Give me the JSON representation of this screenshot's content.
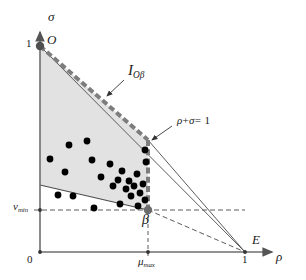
{
  "figure": {
    "colors": {
      "axis": "#6e6e6e",
      "shade_fill": "#e2e2e2",
      "shade_stroke": "#5a5a5a",
      "thick_dashed": "#7d7d7d",
      "thin_line": "#6b6b6b",
      "dashed_guide": "#4a4a4a",
      "dot": "#000000",
      "text": "#1a1a1a"
    },
    "axes": {
      "y_label": "σ",
      "x_label": "ρ",
      "origin_label": "0",
      "y_tick_label": "1",
      "x_tick_label": "1"
    },
    "labels": {
      "point_O": "O",
      "point_E": "E",
      "point_beta": "β",
      "interval_I": "I",
      "interval_I_sub": "Oβ",
      "constraint_line": "ρ + σ = 1",
      "constraint_rho": "ρ",
      "constraint_plus": "+",
      "constraint_sigma": "σ",
      "constraint_eq": "= 1",
      "nu_min": "ν",
      "nu_min_sub": "min",
      "mu_max": "μ",
      "mu_max_sub": "max"
    },
    "geometry": {
      "origin": [
        40,
        252
      ],
      "point_O": [
        40,
        46
      ],
      "point_E": [
        245,
        252
      ],
      "apex": [
        148,
        140
      ],
      "point_beta": [
        148,
        210
      ],
      "lower_left": [
        40,
        185
      ],
      "nu_min_y": 210,
      "mu_max_x": 148,
      "polygon": "40,46 148,140 148,210 40,185"
    },
    "chart_data": {
      "type": "scatter",
      "title": "",
      "xlabel": "ρ",
      "ylabel": "σ",
      "xlim": [
        0,
        1
      ],
      "ylim": [
        0,
        1
      ],
      "grid": false,
      "legend": null,
      "annotations": [
        {
          "text": "I_{Oβ}",
          "at": [
            128,
            72
          ]
        },
        {
          "text": "ρ + σ = 1",
          "at": [
            196,
            124
          ]
        },
        {
          "text": "O",
          "at": [
            48,
            42
          ]
        },
        {
          "text": "E",
          "at": [
            255,
            236
          ]
        },
        {
          "text": "β",
          "at": [
            147,
            221
          ]
        },
        {
          "text": "ν_min",
          "at": [
            18,
            208
          ]
        },
        {
          "text": "μ_max",
          "at": [
            146,
            263
          ]
        }
      ],
      "points_px": [
        [
          50,
          159
        ],
        [
          69,
          145
        ],
        [
          65,
          172
        ],
        [
          87,
          141
        ],
        [
          92,
          160
        ],
        [
          101,
          177
        ],
        [
          110,
          164
        ],
        [
          113,
          186
        ],
        [
          118,
          180
        ],
        [
          122,
          171
        ],
        [
          126,
          189
        ],
        [
          129,
          181
        ],
        [
          131,
          196
        ],
        [
          134,
          186
        ],
        [
          137,
          174
        ],
        [
          140,
          193
        ],
        [
          143,
          184
        ],
        [
          145,
          200
        ],
        [
          138,
          206
        ],
        [
          146,
          162
        ],
        [
          145,
          150
        ],
        [
          58,
          195
        ],
        [
          73,
          196
        ],
        [
          94,
          208
        ],
        [
          120,
          204
        ]
      ],
      "points_data": [
        [
          0.049,
          0.451
        ],
        [
          0.141,
          0.519
        ],
        [
          0.122,
          0.388
        ],
        [
          0.229,
          0.539
        ],
        [
          0.254,
          0.446
        ],
        [
          0.298,
          0.364
        ],
        [
          0.341,
          0.427
        ],
        [
          0.356,
          0.32
        ],
        [
          0.38,
          0.35
        ],
        [
          0.4,
          0.393
        ],
        [
          0.42,
          0.306
        ],
        [
          0.434,
          0.345
        ],
        [
          0.444,
          0.272
        ],
        [
          0.459,
          0.32
        ],
        [
          0.473,
          0.379
        ],
        [
          0.488,
          0.287
        ],
        [
          0.502,
          0.33
        ],
        [
          0.512,
          0.253
        ],
        [
          0.478,
          0.224
        ],
        [
          0.517,
          0.437
        ],
        [
          0.512,
          0.495
        ],
        [
          0.088,
          0.277
        ],
        [
          0.161,
          0.272
        ],
        [
          0.263,
          0.214
        ],
        [
          0.39,
          0.233
        ]
      ],
      "point_count": 25
    }
  }
}
